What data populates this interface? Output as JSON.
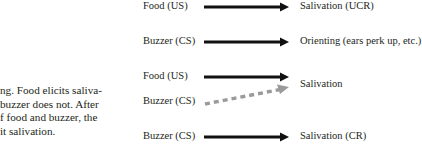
{
  "caption": {
    "lines": [
      "Classical conditioning. Food elicits saliva-",
      "tion, but initially a buzzer does not. After",
      "repeated pairings of food and buzzer, the",
      "buzzer comes to elicit salivation."
    ],
    "visible_lines": [
      "ng. Food elicits saliva-",
      "buzzer does not. After",
      "f food and buzzer, the",
      "it salivation."
    ]
  },
  "diagram": {
    "rows": [
      {
        "stimulus": "Food (US)",
        "response": "Salivation (UCR)",
        "arrow": "solid"
      },
      {
        "stimulus": "Buzzer (CS)",
        "response": "Orienting (ears perk up, etc.)",
        "arrow": "solid"
      },
      {
        "stimulus": "Food (US)",
        "response": "Salivation",
        "arrow": "solid"
      },
      {
        "stimulus": "Buzzer (CS)",
        "response": "",
        "arrow": "dashed"
      },
      {
        "stimulus": "Buzzer (CS)",
        "response": "Salivation (CR)",
        "arrow": "solid"
      }
    ],
    "colors": {
      "text": "#231f20",
      "solid_arrow": "#111111",
      "dashed_arrow": "#9a9a9a"
    }
  }
}
